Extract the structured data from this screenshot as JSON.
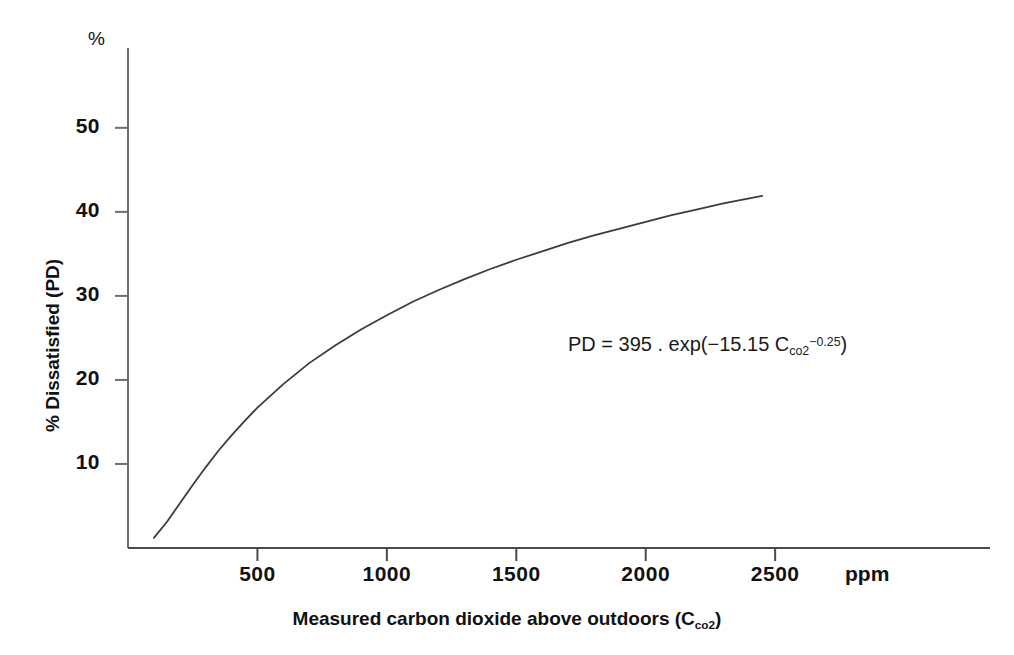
{
  "chart_data": {
    "type": "line",
    "title": "",
    "xlabel": "Measured carbon dioxide above outdoors (Cco2)",
    "xlabel_main": "Measured carbon dioxide above outdoors (C",
    "xlabel_sub": "co2",
    "xlabel_tail": ")",
    "ylabel": "% Dissatisfied (PD)",
    "x_unit": "ppm",
    "y_unit": "%",
    "xlim": [
      0,
      3330
    ],
    "ylim": [
      0,
      59.5
    ],
    "grid": false,
    "legend": null,
    "x_ticks": [
      500,
      1000,
      1500,
      2000,
      2500
    ],
    "x_tick_labels": [
      "500",
      "1000",
      "1500",
      "2000",
      "2500"
    ],
    "y_ticks": [
      10,
      20,
      30,
      40,
      50
    ],
    "y_tick_labels": [
      "10",
      "20",
      "30",
      "40",
      "50"
    ],
    "equation": {
      "lhs": "PD = 395 . exp(−15.15 C",
      "subscript": "co2",
      "superscript": "−0.25",
      "tail": ")",
      "full": "PD = 395 . exp(-15.15 Cco2^-0.25)"
    },
    "series": [
      {
        "name": "Percentage dissatisfied",
        "formula": "PD = 395 * exp(-15.15 * C^-0.25)",
        "color": "#3c3c3c",
        "x": [
          100,
          150,
          200,
          250,
          300,
          350,
          400,
          450,
          500,
          600,
          700,
          800,
          900,
          1000,
          1100,
          1200,
          1300,
          1400,
          1500,
          1600,
          1700,
          1800,
          1900,
          2000,
          2100,
          2200,
          2300,
          2450
        ],
        "y": [
          1.2,
          3.1,
          5.3,
          7.5,
          9.6,
          11.6,
          13.4,
          15.1,
          16.7,
          19.5,
          22.0,
          24.1,
          26.0,
          27.7,
          29.3,
          30.7,
          32.0,
          33.2,
          34.3,
          35.3,
          36.3,
          37.2,
          38.0,
          38.8,
          39.6,
          40.3,
          41.0,
          41.9
        ]
      }
    ]
  },
  "axes": {
    "y_unit_label": "%",
    "x_unit_label": "ppm"
  }
}
